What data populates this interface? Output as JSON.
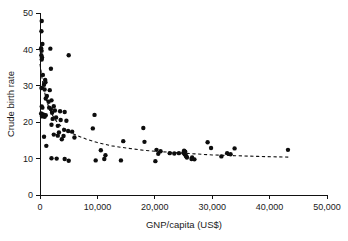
{
  "chart_data": {
    "type": "scatter",
    "title": "",
    "xlabel": "GNP/capita (US$)",
    "ylabel": "Crude birth rate",
    "xlim": [
      0,
      50000
    ],
    "ylim": [
      0,
      50
    ],
    "grid": false,
    "legend": null,
    "xticks": [
      0,
      10000,
      20000,
      30000,
      40000,
      50000
    ],
    "xtick_labels": [
      "0",
      "10,000",
      "20,000",
      "30,000",
      "40,000",
      "50,000"
    ],
    "yticks": [
      0,
      10,
      20,
      30,
      40,
      50
    ],
    "ytick_labels": [
      "0",
      "10",
      "20",
      "30",
      "40",
      "50"
    ],
    "marker": "filled-circle",
    "marker_color": "#0d0d0d",
    "points": [
      [
        300,
        47.8
      ],
      [
        250,
        45.0
      ],
      [
        420,
        41.5
      ],
      [
        200,
        40.3
      ],
      [
        1800,
        40.2
      ],
      [
        280,
        39.6
      ],
      [
        230,
        38.4
      ],
      [
        5000,
        38.4
      ],
      [
        350,
        37.8
      ],
      [
        300,
        37.2
      ],
      [
        1900,
        34.7
      ],
      [
        500,
        33.0
      ],
      [
        900,
        31.6
      ],
      [
        950,
        31.0
      ],
      [
        700,
        30.3
      ],
      [
        250,
        29.4
      ],
      [
        800,
        29.0
      ],
      [
        1700,
        28.8
      ],
      [
        1200,
        27.2
      ],
      [
        1000,
        26.5
      ],
      [
        2000,
        26.0
      ],
      [
        1500,
        25.6
      ],
      [
        300,
        24.3
      ],
      [
        420,
        24.0
      ],
      [
        1600,
        24.0
      ],
      [
        2400,
        24.4
      ],
      [
        1900,
        23.6
      ],
      [
        2600,
        23.2
      ],
      [
        3500,
        23.0
      ],
      [
        200,
        22.4
      ],
      [
        300,
        22.2
      ],
      [
        500,
        22.1
      ],
      [
        700,
        22.0
      ],
      [
        1000,
        21.9
      ],
      [
        2100,
        22.6
      ],
      [
        4300,
        22.8
      ],
      [
        9500,
        22.0
      ],
      [
        350,
        21.6
      ],
      [
        800,
        21.5
      ],
      [
        2800,
        21.3
      ],
      [
        2200,
        20.9
      ],
      [
        3600,
        20.6
      ],
      [
        4600,
        20.4
      ],
      [
        2000,
        19.3
      ],
      [
        3100,
        19.0
      ],
      [
        9200,
        18.3
      ],
      [
        18000,
        18.4
      ],
      [
        4200,
        17.9
      ],
      [
        4900,
        17.6
      ],
      [
        5600,
        17.4
      ],
      [
        3300,
        17.2
      ],
      [
        2400,
        16.6
      ],
      [
        3100,
        16.3
      ],
      [
        4100,
        16.2
      ],
      [
        700,
        16.0
      ],
      [
        6000,
        15.8
      ],
      [
        3800,
        15.3
      ],
      [
        14500,
        14.8
      ],
      [
        18200,
        14.6
      ],
      [
        29200,
        14.5
      ],
      [
        1100,
        13.5
      ],
      [
        29800,
        12.9
      ],
      [
        33900,
        12.8
      ],
      [
        43200,
        12.4
      ],
      [
        10600,
        12.3
      ],
      [
        20300,
        12.4
      ],
      [
        21000,
        12.0
      ],
      [
        25100,
        12.2
      ],
      [
        25300,
        11.9
      ],
      [
        25000,
        11.6
      ],
      [
        24200,
        11.5
      ],
      [
        22600,
        11.5
      ],
      [
        23400,
        11.4
      ],
      [
        20600,
        11.3
      ],
      [
        25200,
        11.2
      ],
      [
        32600,
        11.5
      ],
      [
        33200,
        11.2
      ],
      [
        11400,
        10.9
      ],
      [
        25400,
        10.8
      ],
      [
        25500,
        10.6
      ],
      [
        31600,
        10.6
      ],
      [
        25600,
        10.3
      ],
      [
        26500,
        10.3
      ],
      [
        2000,
        10.1
      ],
      [
        26400,
        9.9
      ],
      [
        2900,
        10.0
      ],
      [
        11200,
        9.9
      ],
      [
        4300,
        9.9
      ],
      [
        9700,
        9.5
      ],
      [
        14100,
        9.5
      ],
      [
        20100,
        9.3
      ],
      [
        5000,
        9.4
      ],
      [
        26900,
        9.8
      ]
    ],
    "trend_line": {
      "style": "dashed",
      "color": "#111111",
      "label": "fitted curve",
      "x": [
        0,
        500,
        1000,
        1500,
        2000,
        2600,
        3200,
        4000,
        5000,
        6500,
        8000,
        10000,
        12500,
        15000,
        18000,
        21000,
        24000,
        27000,
        30000,
        34000,
        38000,
        43500
      ],
      "y": [
        36.0,
        30.5,
        26.8,
        24.2,
        22.4,
        20.8,
        19.6,
        18.4,
        17.4,
        16.3,
        15.4,
        14.4,
        13.5,
        12.9,
        12.3,
        11.9,
        11.6,
        11.3,
        11.0,
        10.8,
        10.6,
        10.4
      ]
    }
  }
}
